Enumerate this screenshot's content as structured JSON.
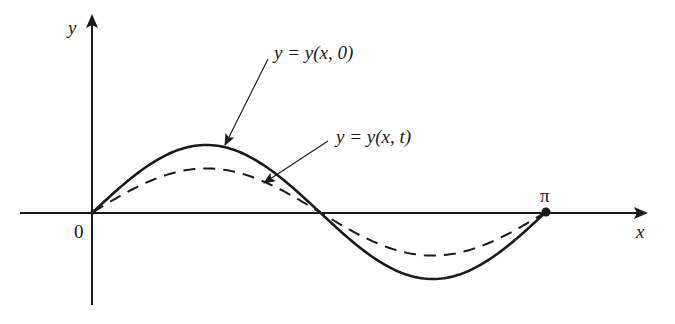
{
  "figure": {
    "type": "wave-diagram",
    "axes": {
      "x_label": "x",
      "y_label": "y",
      "origin_label": "0",
      "endpoint_label": "π"
    },
    "curves": [
      {
        "name": "initial-displacement",
        "label": "y = y(x, 0)",
        "style": "solid",
        "shape": "sin(2x)",
        "relative_amplitude": 1.0
      },
      {
        "name": "displacement-at-time-t",
        "label": "y = y(x, t)",
        "style": "dashed",
        "shape": "sin(2x)",
        "relative_amplitude": 0.65
      }
    ],
    "domain": [
      "0",
      "π"
    ],
    "colors": {
      "ink": "#1a1a1a",
      "background": "#ffffff"
    }
  },
  "chart_data": {
    "type": "line",
    "title": "",
    "xlabel": "x",
    "ylabel": "y",
    "xlim": [
      0,
      3.1416
    ],
    "x_ticks": [
      "0",
      "π"
    ],
    "series": [
      {
        "name": "y = y(x, 0)",
        "style": "solid",
        "function": "A·sin(2x)",
        "amplitude": 1.0
      },
      {
        "name": "y = y(x, t)",
        "style": "dashed",
        "function": "0.65·A·sin(2x)",
        "amplitude": 0.65
      }
    ],
    "grid": false,
    "legend": "annotations with leader arrows"
  }
}
